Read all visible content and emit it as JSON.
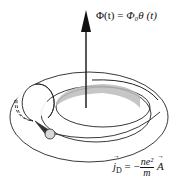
{
  "diagram": {
    "flux_label": {
      "lhs": "Φ(t)",
      "eq": " = ",
      "rhs": "Φ₀θ (t)"
    },
    "current_label": {
      "lhs": "j",
      "lhs_sub": "D",
      "eq": " = −",
      "numerator": "ne²",
      "denominator": "m",
      "rhs": "A"
    },
    "elements": [
      "vertical-flux-arrow",
      "torus-outer-ring",
      "torus-inner-ring",
      "cross-section-circle",
      "shaded-hole-surface",
      "current-arc",
      "cone-cylinder-indicator"
    ],
    "colors": {
      "stroke": "#222222",
      "shading": "#b8b8b8",
      "cylinder": "#d8d8d8"
    }
  }
}
